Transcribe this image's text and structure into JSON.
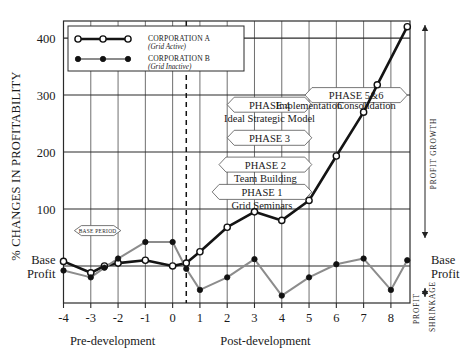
{
  "axes": {
    "ylabel": "% CHANGES IN PROFITABILITY",
    "yticks": [
      "400",
      "300",
      "200",
      "100"
    ],
    "ybase_line1": "Base",
    "ybase_line2": "Profit",
    "xticks": [
      "-4",
      "-3",
      "-2",
      "-1",
      "0",
      "1",
      "2",
      "3",
      "4",
      "5",
      "6",
      "7",
      "8"
    ],
    "xgroup_left": "Pre-development",
    "xgroup_right": "Post-development"
  },
  "legend": {
    "series_a_name": "CORPORATION A",
    "series_a_sub": "(Grid Active)",
    "series_b_name": "CORPORATION B",
    "series_b_sub": "(Grid Inactive)"
  },
  "annotations": {
    "base_period": "BASE PERIOD",
    "phase1": "PHASE 1",
    "phase1_sub": "Grid Seminars",
    "phase2": "PHASE 2",
    "phase2_sub": "Team Building",
    "phase3": "PHASE 3",
    "phase4": "PHASE 4",
    "phase4_sub": "Ideal Strategic Model",
    "phase56": "PHASE 5&6",
    "implementation": "Implementation",
    "consolidation": "Consolidation"
  },
  "right_side": {
    "profit_growth": "PROFIT GROWTH",
    "base_line1": "Base",
    "base_line2": "Profit",
    "profit_word": "PROFIT",
    "shrinkage_word": "SHRINKAGE"
  },
  "colors": {
    "series_a": "#141414",
    "series_b": "#8c8c8c",
    "grid": "#4a4a4a",
    "frame": "#2a2a2a",
    "background": "#ffffff"
  },
  "chart_data": {
    "type": "line",
    "title": "",
    "xlabel": "",
    "ylabel": "% CHANGES IN PROFITABILITY",
    "xlim": [
      -4,
      8.7
    ],
    "ylim": [
      -65,
      430
    ],
    "grid": true,
    "legend_position": "top-left",
    "baseline_value": 0,
    "baseline_label": "Base Profit",
    "divider_x": 0.5,
    "xtick_values": [
      -4,
      -3,
      -2,
      -1,
      0,
      1,
      2,
      3,
      4,
      5,
      6,
      7,
      8
    ],
    "ytick_values": [
      0,
      100,
      200,
      300,
      400
    ],
    "ytick_labels": [
      "Base Profit",
      "100",
      "200",
      "300",
      "400"
    ],
    "series": [
      {
        "name": "CORPORATION A",
        "sublabel": "(Grid Active)",
        "color": "#141414",
        "marker": "open-circle",
        "x": [
          -4,
          -3,
          -2.5,
          -2,
          -1,
          0,
          0.5,
          1,
          2,
          3,
          4,
          5,
          6,
          7,
          7.5,
          8.6
        ],
        "y": [
          8,
          -12,
          0,
          5,
          10,
          0,
          5,
          25,
          68,
          95,
          80,
          115,
          193,
          270,
          318,
          420
        ]
      },
      {
        "name": "CORPORATION B",
        "sublabel": "(Grid Inactive)",
        "color": "#8c8c8c",
        "marker": "filled-circle",
        "x": [
          -4,
          -3,
          -2.5,
          -2,
          -1,
          0,
          0.5,
          1,
          2,
          3,
          4,
          5,
          6,
          7,
          8,
          8.6
        ],
        "y": [
          -8,
          -20,
          -3,
          13,
          42,
          42,
          -5,
          -42,
          -20,
          12,
          -52,
          -20,
          3,
          13,
          -42,
          10
        ]
      }
    ],
    "annotations": [
      {
        "label": "BASE PERIOD",
        "x_start": -3.6,
        "x_end": -1.9,
        "y": 62
      },
      {
        "label": "PHASE 1",
        "sub": "Grid Seminars",
        "x_start": 1.45,
        "x_end": 5.1,
        "y": 130
      },
      {
        "label": "PHASE 2",
        "sub": "Team Building",
        "x_start": 1.7,
        "x_end": 5.1,
        "y": 178
      },
      {
        "label": "PHASE 3",
        "x_start": 2.0,
        "x_end": 5.1,
        "y": 225
      },
      {
        "label": "PHASE 4",
        "sub": "Ideal Strategic Model",
        "x_start": 2.0,
        "x_end": 5.1,
        "y": 283
      },
      {
        "label": "PHASE 5&6",
        "x_start": 4.85,
        "x_end": 8.6,
        "y": 300
      },
      {
        "label": "Implementation",
        "x": 5.0,
        "y": 283
      },
      {
        "label": "Consolidation",
        "x": 7.1,
        "y": 283
      }
    ],
    "side_axis_labels": [
      "PROFIT GROWTH",
      "Base Profit",
      "PROFIT SHRINKAGE"
    ]
  }
}
